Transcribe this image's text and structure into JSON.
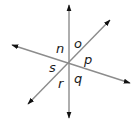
{
  "diagram": {
    "line_color": "#8c8c8c",
    "arrow_color": "#111111",
    "intersection": [
      69,
      63
    ],
    "lines": [
      {
        "name": "vertical-line",
        "from": [
          69,
          5
        ],
        "to": [
          69,
          118
        ]
      },
      {
        "name": "line-upperleft-lowerright",
        "from": [
          12,
          45
        ],
        "to": [
          130,
          83
        ]
      },
      {
        "name": "line-lowerleft-upperright",
        "from": [
          28,
          104
        ],
        "to": [
          110,
          20
        ]
      }
    ],
    "angle_labels": [
      {
        "text": "n",
        "x": 56,
        "y": 53
      },
      {
        "text": "o",
        "x": 74,
        "y": 48
      },
      {
        "text": "p",
        "x": 84,
        "y": 64
      },
      {
        "text": "q",
        "x": 74,
        "y": 83
      },
      {
        "text": "r",
        "x": 58,
        "y": 88
      },
      {
        "text": "s",
        "x": 49,
        "y": 72
      }
    ]
  }
}
